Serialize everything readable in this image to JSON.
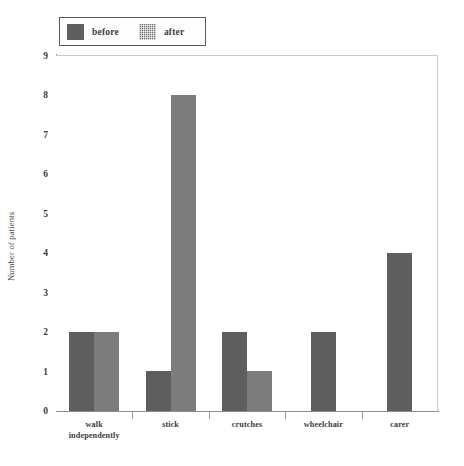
{
  "legend": {
    "entries": [
      {
        "label": "before",
        "swatch": "solid-dark-gray",
        "color": "#5e5e5e"
      },
      {
        "label": "after",
        "swatch": "dotted-gray",
        "color": "#7c7c7c"
      }
    ]
  },
  "axes": {
    "y_title": "Number of patients",
    "y_ticks": [
      "0",
      "1",
      "2",
      "3",
      "4",
      "5",
      "6",
      "7",
      "8",
      "9"
    ],
    "x_labels": [
      [
        "walk",
        "independently"
      ],
      [
        "stick"
      ],
      [
        "crutches"
      ],
      [
        "wheelchair"
      ],
      [
        "carer"
      ]
    ]
  },
  "chart_data": {
    "type": "bar",
    "title": "",
    "xlabel": "",
    "ylabel": "Number of patients",
    "categories": [
      "walk independently",
      "stick",
      "crutches",
      "wheelchair",
      "carer"
    ],
    "series": [
      {
        "name": "before",
        "values": [
          2,
          1,
          2,
          2,
          4
        ],
        "color": "#5e5e5e"
      },
      {
        "name": "after",
        "values": [
          2,
          8,
          1,
          0,
          0
        ],
        "color": "#7c7c7c"
      }
    ],
    "ylim": [
      0,
      9
    ],
    "ytick_step": 1,
    "grid": false,
    "legend_position": "top-left-outside"
  }
}
